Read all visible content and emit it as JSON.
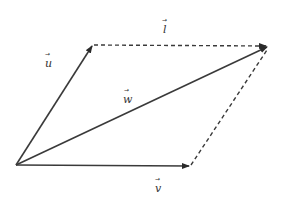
{
  "diagram": {
    "colors": {
      "line": "#3a3a3a",
      "dashed": "#3a3a3a",
      "label": "#333333",
      "background": "#ffffff"
    },
    "points": {
      "origin": [
        16,
        165
      ],
      "u_tip": [
        93,
        45
      ],
      "v_tip": [
        190,
        166
      ],
      "w_tip": [
        268,
        47
      ]
    },
    "vectors": [
      {
        "name": "u",
        "label": "u",
        "arrow": "→",
        "style": "solid",
        "from": "origin",
        "to": "u_tip",
        "label_pos": [
          48,
          64
        ]
      },
      {
        "name": "v",
        "label": "v",
        "arrow": "→",
        "style": "solid",
        "from": "origin",
        "to": "v_tip",
        "label_pos": [
          157,
          190
        ]
      },
      {
        "name": "w",
        "label": "w",
        "arrow": "→",
        "style": "solid",
        "from": "origin",
        "to": "w_tip",
        "label_pos": [
          127,
          102
        ]
      },
      {
        "name": "l",
        "label": "l",
        "arrow": "→",
        "style": "dashed",
        "from": "u_tip",
        "to": "w_tip",
        "label_pos": [
          165,
          31
        ]
      },
      {
        "name": "v-translated",
        "label": "",
        "arrow": "",
        "style": "dashed",
        "from": "v_tip",
        "to": "w_tip",
        "label_pos": null
      }
    ],
    "labels": {
      "u": "u",
      "v": "v",
      "w": "w",
      "l": "l",
      "arrow_glyph": "→"
    }
  }
}
